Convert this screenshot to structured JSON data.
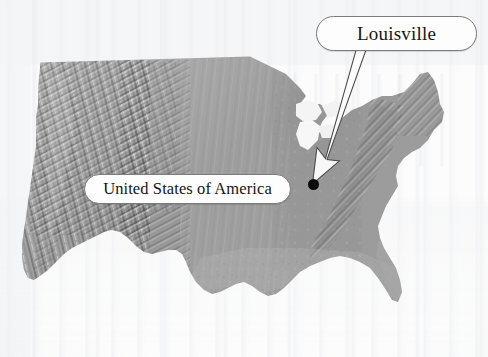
{
  "image": {
    "type": "annotated-relief-map",
    "title": "Shaded relief map of the United States with Louisville annotated",
    "width": 488,
    "height": 357,
    "background_color": "#fcfcfc"
  },
  "map": {
    "name": "United States shaded relief",
    "style": "grayscale hillshade",
    "land_color_light": "#d2d2d2",
    "land_color_mid": "#9a9a9a",
    "land_color_dark": "#2e2e2e",
    "water_color": "#f4f4f4"
  },
  "callouts": [
    {
      "id": "louisville",
      "label": "Louisville",
      "shape": "stadium",
      "fill": "#fdfdfd",
      "border_color": "#7b7b7b",
      "text_color": "#161616"
    },
    {
      "id": "united-states-of-america",
      "label": "United States of America",
      "shape": "stadium",
      "fill": "#fdfdfd",
      "border_color": "#7b7b7b",
      "text_color": "#161616"
    }
  ],
  "leader": {
    "name": "arrow-from-louisville-label-to-marker",
    "fill": "#ffffff",
    "stroke": "#4a4a4a",
    "points_to": "Louisville marker"
  },
  "marker": {
    "name": "louisville-point-marker",
    "shape": "filled-circle",
    "color": "#0b0b0b"
  }
}
